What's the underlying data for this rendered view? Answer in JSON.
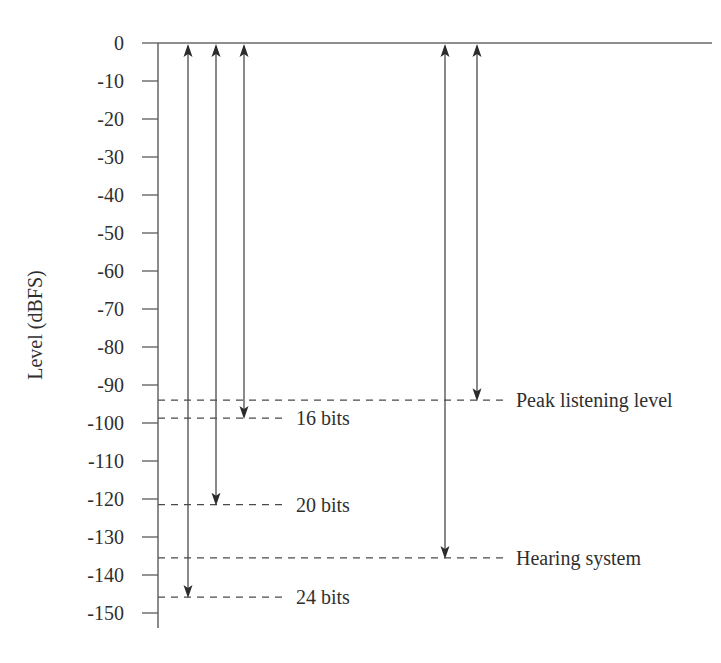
{
  "chart_data": {
    "type": "line",
    "title": "",
    "subtitle": "",
    "xlabel": "",
    "ylabel": "Level (dBFS)",
    "ylim": [
      -155,
      2
    ],
    "xlim": [
      0,
      100
    ],
    "grid": false,
    "legend": "none",
    "y_ticks": [
      0,
      -10,
      -20,
      -30,
      -40,
      -50,
      -60,
      -70,
      -80,
      -90,
      -100,
      -110,
      -120,
      -130,
      -140,
      -150
    ],
    "y_tick_labels": [
      "0",
      "-10",
      "-20",
      "-30",
      "-40",
      "-50",
      "-60",
      "-70",
      "-80",
      "-90",
      "-100",
      "-110",
      "-120",
      "-130",
      "-140",
      "-150"
    ],
    "reference_top": 0,
    "annotations": [
      {
        "name": "24-bits",
        "label": "24 bits",
        "level_db": -145.8,
        "arrow_x": 188,
        "label_x": 296,
        "dash_from_x": 158,
        "dash_to_x": 284,
        "arrow_direction": "both"
      },
      {
        "name": "20-bits",
        "label": "20 bits",
        "level_db": -121.5,
        "arrow_x": 216,
        "label_x": 296,
        "dash_from_x": 158,
        "dash_to_x": 284,
        "arrow_direction": "both"
      },
      {
        "name": "16-bits",
        "label": "16 bits",
        "level_db": -98.7,
        "arrow_x": 244,
        "label_x": 296,
        "dash_from_x": 158,
        "dash_to_x": 284,
        "arrow_direction": "both"
      },
      {
        "name": "hearing-system",
        "label": "Hearing system",
        "level_db": -135.5,
        "arrow_x": 445,
        "label_x": 516,
        "dash_from_x": 158,
        "dash_to_x": 504,
        "arrow_direction": "both"
      },
      {
        "name": "peak-listening-level",
        "label": "Peak listening level",
        "level_db": -94.0,
        "arrow_x": 477,
        "label_x": 516,
        "dash_from_x": 158,
        "dash_to_x": 504,
        "arrow_direction": "both"
      }
    ],
    "series": [
      {
        "name": "24 bits dynamic range",
        "values": [
          0,
          -145.8
        ]
      },
      {
        "name": "20 bits dynamic range",
        "values": [
          0,
          -121.5
        ]
      },
      {
        "name": "16 bits dynamic range",
        "values": [
          0,
          -98.7
        ]
      },
      {
        "name": "Hearing system dynamic range",
        "values": [
          0,
          -135.5
        ]
      },
      {
        "name": "Peak listening level range",
        "values": [
          0,
          -94.0
        ]
      }
    ],
    "colors": {
      "axis": "#5a5a5a",
      "arrow": "#2b2b2b",
      "dash": "#4a4a4a",
      "text": "#2f2f2f",
      "background": "#ffffff"
    },
    "geometry": {
      "axis_x": 158,
      "y_zero_px": 43,
      "px_per_db": 3.8,
      "axis_bottom_px": 628,
      "top_rule_from_x": 158,
      "top_rule_to_x": 712,
      "tick_length": 16,
      "tick_label_x": 146,
      "axis_title_x": 42,
      "axis_title_y": 325
    }
  }
}
